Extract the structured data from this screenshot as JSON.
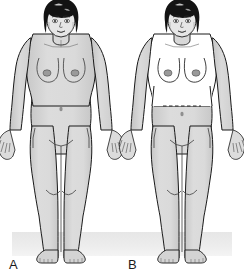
{
  "figure": {
    "background_color": "#ffffff",
    "width": 244,
    "height": 278
  },
  "panels": [
    {
      "id": "panel-a",
      "label": "A",
      "label_x": 9,
      "label_y": 258,
      "center_x": 61,
      "subject": "adult female standing figure, anterior view, arms at sides",
      "shading": "entire body shaded uniform gray",
      "shaded_regions": [
        "head-neck",
        "torso",
        "arms",
        "pelvis",
        "legs",
        "feet"
      ],
      "has_waist_marker": false,
      "waist_marker_style": "none"
    },
    {
      "id": "panel-b",
      "label": "B",
      "label_x": 128,
      "label_y": 258,
      "center_x": 182,
      "subject": "adult female standing figure, anterior view, arms at sides",
      "shading": "upper torso and chest unshaded white; body shaded gray from waist down, plus head and arms",
      "shaded_regions": [
        "head-neck",
        "arms",
        "pelvis",
        "legs",
        "feet"
      ],
      "unshaded_regions": [
        "chest",
        "upper-torso",
        "abdomen-above-waist"
      ],
      "has_waist_marker": true,
      "waist_marker_style": "horizontal dashed line at waist",
      "waist_marker_y": 106,
      "waist_marker_x_start": 163,
      "waist_marker_x_end": 203
    }
  ],
  "colors": {
    "outline": "#1a1a1a",
    "body_fill_shaded": "#d6d6d6",
    "body_fill_unshaded": "#ffffff",
    "body_shadow": "#bdbdbd",
    "hair": "#111111",
    "hair_highlight": "#ffffff",
    "nipple": "#8d8d8d",
    "ground_band": "#ebebeb",
    "label_text": "#1b1b1b",
    "dashed_line": "#2a2a2a"
  },
  "ground": {
    "present": true,
    "description": "light gray horizontal floor band behind the feet",
    "y_top": 232,
    "y_bottom": 256,
    "x_start": 12,
    "x_end": 232
  },
  "anatomy_features": [
    "bob hairstyle",
    "face with eyes, nose, lips",
    "neck and clavicles",
    "breasts with nipples",
    "navel",
    "pubic triangle crease",
    "knees",
    "hands with fingers",
    "feet with toes"
  ]
}
